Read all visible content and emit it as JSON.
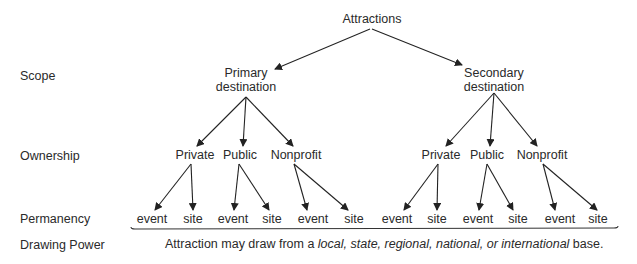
{
  "diagram": {
    "root": "Attractions",
    "row_labels": {
      "scope": "Scope",
      "ownership": "Ownership",
      "permanency": "Permanency",
      "drawing_power": "Drawing Power"
    },
    "scope_nodes": [
      {
        "line1": "Primary",
        "line2": "destination"
      },
      {
        "line1": "Secondary",
        "line2": "destination"
      }
    ],
    "ownership_nodes": [
      "Private",
      "Public",
      "Nonprofit",
      "Private",
      "Public",
      "Nonprofit"
    ],
    "permanency_nodes": [
      "event",
      "site",
      "event",
      "site",
      "event",
      "site",
      "event",
      "site",
      "event",
      "site",
      "event",
      "site"
    ],
    "caption": {
      "prefix": "Attraction may draw from a ",
      "italic": "local, state, regional, national, or international",
      "suffix": " base."
    }
  }
}
